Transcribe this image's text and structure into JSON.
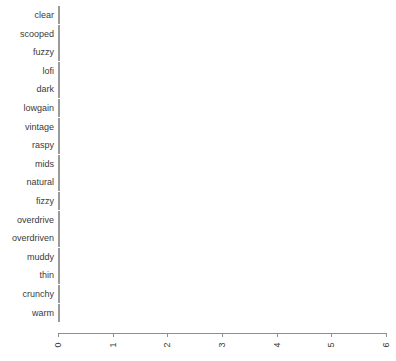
{
  "chart_data": {
    "type": "bar",
    "orientation": "horizontal",
    "title": "",
    "xlabel": "",
    "ylabel": "",
    "xlim": [
      0,
      6
    ],
    "grid": false,
    "legend": null,
    "xticks": [
      0,
      1,
      2,
      3,
      4,
      5,
      6
    ],
    "xtick_labels": [
      "0",
      "1",
      "2",
      "3",
      "4",
      "5",
      "6"
    ],
    "categories": [
      "clear",
      "scooped",
      "fuzzy",
      "lofi",
      "dark",
      "lowgain",
      "vintage",
      "raspy",
      "mids",
      "natural",
      "fizzy",
      "overdrive",
      "overdriven",
      "muddy",
      "thin",
      "crunchy",
      "warm"
    ],
    "values": [
      2,
      2,
      2,
      2,
      2,
      2,
      2,
      2,
      2,
      2,
      3,
      3,
      3,
      3,
      4,
      5,
      6
    ],
    "bar_color": "#c3c3c3",
    "bar_border_color": "#9a9a9a",
    "axis_color": "#8f8f8f",
    "text_color": "#3a3a3a",
    "background": "#ffffff"
  }
}
